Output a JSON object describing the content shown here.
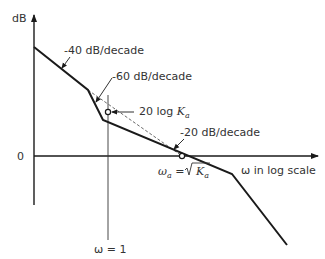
{
  "diagram": {
    "axes": {
      "y_label": "dB",
      "x_label": "ω in log scale",
      "zero_label": "0"
    },
    "annotations": {
      "slope_40": "-40 dB/decade",
      "slope_60": "-60 dB/decade",
      "slope_20": "-20 dB/decade",
      "gain_label_prefix": "20 log ",
      "gain_label_var": "K",
      "gain_label_sub": "a",
      "omega_a_label_var": "ω",
      "omega_a_label_sub": "a",
      "omega_a_label_eq": " = ",
      "omega_a_sqrt_var": "K",
      "omega_a_sqrt_sub": "a",
      "omega_one_label": "ω = 1"
    },
    "colors": {
      "line": "#1a1a1a",
      "text": "#333333",
      "background": "#ffffff"
    }
  }
}
